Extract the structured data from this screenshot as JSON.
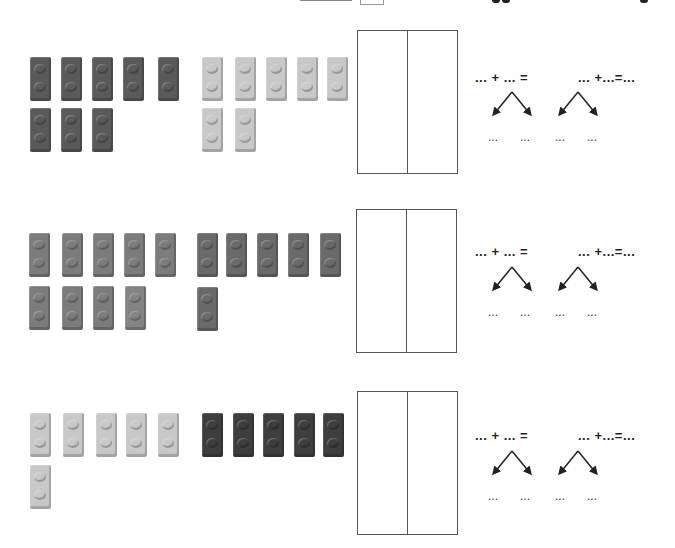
{
  "colors": {
    "dark": "#5a5a5a",
    "light": "#c8c8c8",
    "medium": "#7c7c7c",
    "medium_dark": "#6a6a6a",
    "very_dark": "#3e3e3e",
    "box_border": "#555555"
  },
  "exercises": [
    {
      "group_a": {
        "color": "dark",
        "count": 8
      },
      "group_b": {
        "color": "light",
        "count": 7
      },
      "equation_left": "... + ... =",
      "equation_right": "... +...=...",
      "split_labels": [
        "...",
        "...",
        "...",
        "..."
      ]
    },
    {
      "group_a": {
        "color": "medium",
        "count": 9
      },
      "group_b": {
        "color": "medium_dark",
        "count": 6
      },
      "equation_left": "... + ... =",
      "equation_right": "... +...=...",
      "split_labels": [
        "...",
        "...",
        "...",
        "..."
      ]
    },
    {
      "group_a": {
        "color": "light",
        "count": 6
      },
      "group_b": {
        "color": "very_dark",
        "count": 5
      },
      "equation_left": "... + ... =",
      "equation_right": "... +...=...",
      "split_labels": [
        "...",
        "...",
        "...",
        "..."
      ]
    }
  ]
}
